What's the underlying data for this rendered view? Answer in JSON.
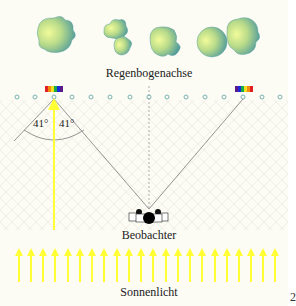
{
  "labels": {
    "axis": "Regenbogenachse",
    "observer": "Beobachter",
    "sunlight": "Sonnenlicht",
    "angle_left": "41°",
    "angle_right": "41°",
    "page_number": "2"
  },
  "colors": {
    "background": "#fcfcf5",
    "sun_arrow": "#ffff33",
    "ray_line": "#888888",
    "droplet": "#6aa9a8",
    "cloud_light": "#e8f598",
    "cloud_dark": "#4d9a9e"
  },
  "droplets_count": 15,
  "sun_arrows_count": 22,
  "spectrum_colors": [
    "#5a1a8a",
    "#1a2ad8",
    "#19a84a",
    "#f0e020",
    "#f08a10",
    "#e02020"
  ]
}
